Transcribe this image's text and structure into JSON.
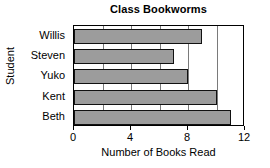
{
  "chart_data": {
    "type": "bar",
    "orientation": "horizontal",
    "title": "Class Bookworms",
    "xlabel": "Number of Books Read",
    "ylabel": "Student",
    "categories": [
      "Willis",
      "Steven",
      "Yuko",
      "Kent",
      "Beth"
    ],
    "values": [
      9,
      7,
      8,
      10,
      11
    ],
    "xlim": [
      0,
      12
    ],
    "xticks": [
      0,
      4,
      8,
      12
    ],
    "xticklabels": [
      "0",
      "4",
      "8",
      "12"
    ],
    "gridlines_at": [
      2,
      4,
      6,
      8,
      10
    ],
    "grid": true,
    "legend": null,
    "bar_color": "#9c9c9c",
    "bar_edge_color": "#111111",
    "frame_color": "#000000",
    "background": "#ffffff"
  }
}
